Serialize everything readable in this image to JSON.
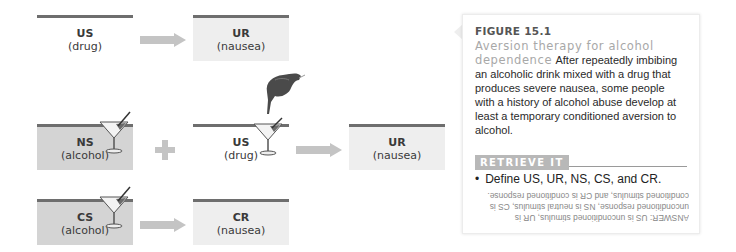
{
  "diagram": {
    "row1": {
      "us": {
        "abbr": "US",
        "desc": "(drug)"
      },
      "ur": {
        "abbr": "UR",
        "desc": "(nausea)"
      }
    },
    "row2": {
      "ns": {
        "abbr": "NS",
        "desc": "(alcohol)"
      },
      "us": {
        "abbr": "US",
        "desc": "(drug)"
      },
      "ur": {
        "abbr": "UR",
        "desc": "(nausea)"
      }
    },
    "row3": {
      "cs": {
        "abbr": "CS",
        "desc": "(alcohol)"
      },
      "cr": {
        "abbr": "CR",
        "desc": "(nausea)"
      }
    },
    "colors": {
      "line": "#6e6e6e",
      "light_box": "#eeeeee",
      "dark_box": "#d4d4d4",
      "arrow": "#c4c4c4"
    }
  },
  "figure": {
    "number": "FIGURE 15.1",
    "title": "Aversion therapy for alcohol dependence",
    "caption": "After repeatedly imbibing an alcoholic drink mixed with a drug that produces severe nausea, some people with a history of alcohol abuse develop at least a temporary conditioned aversion to alcohol."
  },
  "retrieve": {
    "label": "RETRIEVE IT",
    "question": "Define US, UR, NS, CS, and CR.",
    "bullet": "•",
    "answer": "ANSWER: US is unconditioned stimulus, UR is unconditioned response, NS is neutral stimulus, CS is conditioned stimulus, and CR is conditioned response."
  }
}
